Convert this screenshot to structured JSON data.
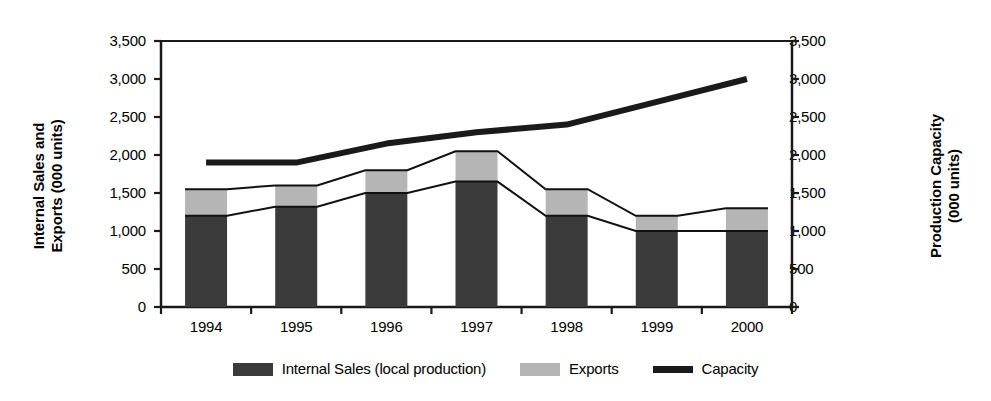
{
  "chart_data": {
    "type": "bar",
    "title": "",
    "subtitle": "",
    "categories": [
      "1994",
      "1995",
      "1996",
      "1997",
      "1998",
      "1999",
      "2000"
    ],
    "xlabel": "",
    "ylabel": "Internal Sales and\nExports (000 units)",
    "ylabel_secondary": "Production Capacity\n(000 units)",
    "ylim": [
      0,
      3500
    ],
    "ylim_secondary": [
      0,
      3500
    ],
    "ytick_values": [
      0,
      500,
      1000,
      1500,
      2000,
      2500,
      3000,
      3500
    ],
    "ytick_labels": [
      "0",
      "500",
      "1,000",
      "1,500",
      "2,000",
      "2,500",
      "3,000",
      "3,500"
    ],
    "ytick_labels_secondary": [
      "0",
      "500",
      "1,000",
      "1,500",
      "2,000",
      "2,500",
      "3,000",
      "3,500"
    ],
    "grid": false,
    "stacked": true,
    "legend_position": "bottom",
    "series": [
      {
        "name": "Internal Sales (local production)",
        "kind": "bar",
        "color": "#3b3b3b",
        "values": [
          1200,
          1320,
          1500,
          1650,
          1200,
          1000,
          1000
        ]
      },
      {
        "name": "Exports",
        "kind": "bar",
        "color": "#b5b5b5",
        "values": [
          350,
          280,
          300,
          400,
          350,
          200,
          300
        ]
      },
      {
        "name": "Capacity",
        "kind": "line",
        "axis": "secondary",
        "color": "#1a1a1a",
        "values": [
          1900,
          1900,
          2150,
          2300,
          2400,
          2700,
          3000
        ]
      }
    ],
    "totals": [
      1550,
      1600,
      1800,
      2050,
      1550,
      1200,
      1300
    ],
    "annotations": []
  },
  "legend": {
    "items": [
      {
        "label": "Internal Sales (local production)",
        "swatch": "filled-box",
        "color": "#3b3b3b"
      },
      {
        "label": "Exports",
        "swatch": "filled-box",
        "color": "#b5b5b5"
      },
      {
        "label": "Capacity",
        "swatch": "line",
        "color": "#1a1a1a"
      }
    ]
  }
}
